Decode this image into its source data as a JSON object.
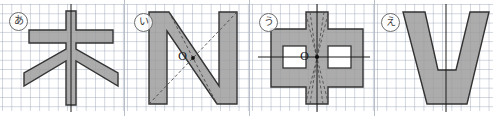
{
  "figure": {
    "background_color": "#ffffff",
    "grid_color": "#96a0b4",
    "fill_color": "#9a9a9a",
    "outline_color": "#333333",
    "axis_color": "#1a1a1a",
    "dash_color": "#4a4a4a",
    "width": 493,
    "height": 116
  },
  "panels": [
    {
      "tag": "あ",
      "tag_name": "panel-label-a",
      "shape_name": "kanji-ki-asterisk-shape",
      "shape_text": "木",
      "axis": "vertical",
      "axis_label": "",
      "center_point": false,
      "center_label": "",
      "dashed_lines": false,
      "holes": 0
    },
    {
      "tag": "い",
      "tag_name": "panel-label-i",
      "shape_name": "letter-n-shape",
      "shape_text": "N",
      "axis": "none",
      "axis_label": "",
      "center_point": true,
      "center_label": "O",
      "dashed_lines": true,
      "holes": 0
    },
    {
      "tag": "う",
      "tag_name": "panel-label-u",
      "shape_name": "kanji-naka-cross-shape",
      "shape_text": "中",
      "axis": "both",
      "axis_label": "",
      "center_point": true,
      "center_label": "O",
      "dashed_lines": true,
      "holes": 2
    },
    {
      "tag": "え",
      "tag_name": "panel-label-e",
      "shape_name": "letter-v-shape",
      "shape_text": "V",
      "axis": "vertical",
      "axis_label": "",
      "center_point": false,
      "center_label": "",
      "dashed_lines": false,
      "holes": 0
    }
  ]
}
